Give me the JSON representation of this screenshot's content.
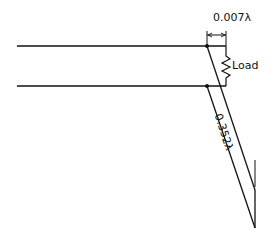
{
  "diagram": {
    "type": "transmission-line-stub",
    "labels": {
      "gap": "0.007λ",
      "load": "Load",
      "stub_length": "0.352λ"
    },
    "colors": {
      "line": "#111111",
      "background": "#ffffff"
    }
  }
}
